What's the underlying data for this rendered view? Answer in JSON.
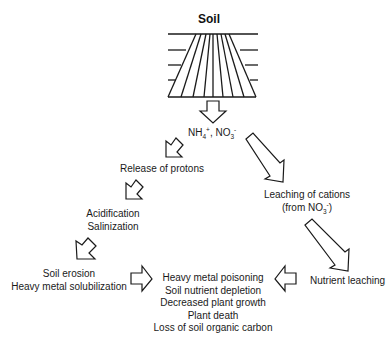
{
  "diagram": {
    "title": "Soil",
    "nodes": {
      "ammonium_nitrate": {
        "main1": "NH",
        "sub1": "4",
        "sup1": "+",
        "sep": ", NO",
        "sub2": "3",
        "sup2": "-"
      },
      "release_protons": "Release of protons",
      "leaching_cations": {
        "line1": "Leaching of cations",
        "line2_pre": "(from NO",
        "line2_sub": "3",
        "line2_sup": "-",
        "line2_post": ")"
      },
      "acidification": {
        "line1": "Acidification",
        "line2": "Salinization"
      },
      "erosion": {
        "line1": "Soil erosion",
        "line2": "Heavy metal solubilization"
      },
      "nutrient_leaching": "Nutrient leaching",
      "effects": [
        "Heavy metal poisoning",
        "Soil nutrient depletion",
        "Decreased plant growth",
        "Plant death",
        "Loss of soil organic carbon"
      ]
    },
    "arrows": [
      {
        "from": "soil",
        "to": "ammonium_nitrate",
        "direction": "down"
      },
      {
        "from": "ammonium_nitrate",
        "to": "release_protons",
        "direction": "down-left"
      },
      {
        "from": "ammonium_nitrate",
        "to": "leaching_cations",
        "direction": "down-right"
      },
      {
        "from": "release_protons",
        "to": "acidification",
        "direction": "down-left"
      },
      {
        "from": "acidification",
        "to": "erosion",
        "direction": "down-left"
      },
      {
        "from": "leaching_cations",
        "to": "nutrient_leaching",
        "direction": "down-right"
      },
      {
        "from": "erosion",
        "to": "effects",
        "direction": "right"
      },
      {
        "from": "nutrient_leaching",
        "to": "effects",
        "direction": "left"
      }
    ],
    "colors": {
      "stroke": "#1a1a1a",
      "fill": "#ffffff",
      "text": "#1a1a1a"
    }
  }
}
